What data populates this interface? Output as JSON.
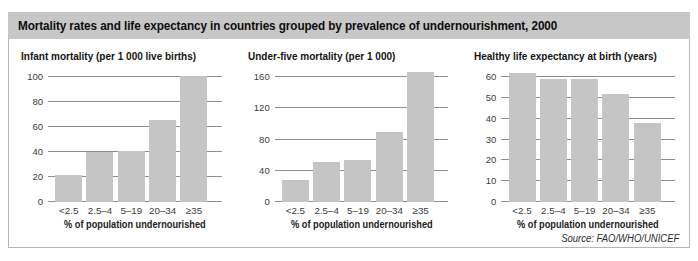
{
  "figure": {
    "title": "Mortality rates and life expectancy in countries grouped by prevalence of undernourishment, 2000",
    "source": "Source: FAO/WHO/UNICEF"
  },
  "colors": {
    "band": "#c7c7c7",
    "bar": "#c5c5c5",
    "gridline": "#8e8e8e"
  },
  "chart_data": [
    {
      "type": "bar",
      "title": "Infant mortality (per 1 000 live births)",
      "categories": [
        "<2.5",
        "2.5–4",
        "5–19",
        "20–34",
        "≥35"
      ],
      "values": [
        22,
        40,
        41,
        66,
        101
      ],
      "xlabel": "% of population undernourished",
      "ylabel": "",
      "ylim": [
        0,
        100
      ],
      "yticks": [
        0,
        20,
        40,
        60,
        80,
        100
      ],
      "grid": true,
      "legend": "none"
    },
    {
      "type": "bar",
      "title": "Under-five mortality (per 1 000)",
      "categories": [
        "<2.5",
        "2.5–4",
        "5–19",
        "20–34",
        "≥35"
      ],
      "values": [
        28,
        51,
        54,
        90,
        167
      ],
      "xlabel": "% of population undernourished",
      "ylabel": "",
      "ylim": [
        0,
        160
      ],
      "yticks": [
        0,
        40,
        80,
        120,
        160
      ],
      "grid": true,
      "legend": "none"
    },
    {
      "type": "bar",
      "title": "Healthy life expectancy at birth (years)",
      "categories": [
        "<2.5",
        "2.5–4",
        "5–19",
        "20–34",
        "≥35"
      ],
      "values": [
        62,
        59,
        59,
        52,
        38
      ],
      "xlabel": "% of population undernourished",
      "ylabel": "",
      "ylim": [
        0,
        60
      ],
      "yticks": [
        0,
        10,
        20,
        30,
        40,
        50,
        60
      ],
      "grid": true,
      "legend": "none"
    }
  ]
}
